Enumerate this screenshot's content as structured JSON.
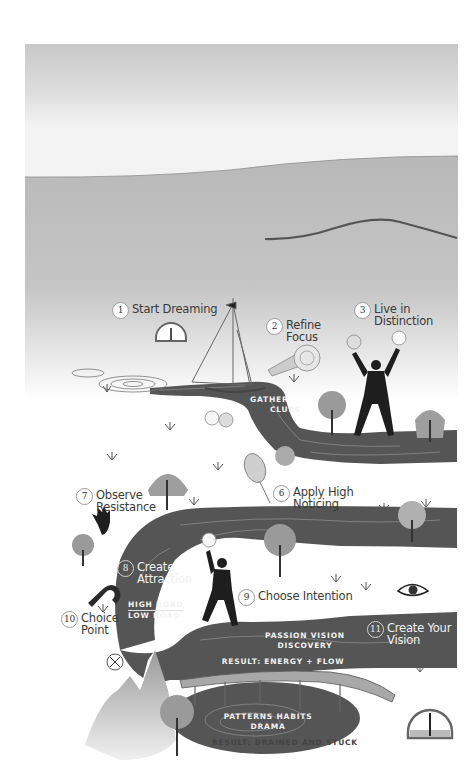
{
  "illustration": {
    "title": "Vision journey map",
    "colors": {
      "sky_top": "#c9c9c9",
      "sky_band": "#f2f2f2",
      "ground": "#bdbdbd",
      "road": "#555555",
      "road_line": "#8a8a8a",
      "figure": "#1e1e1e",
      "text": "#3a3a3a"
    },
    "steps": [
      {
        "number": "1",
        "label": "Start Dreaming"
      },
      {
        "number": "2",
        "label_line1": "Refine",
        "label_line2": "Focus"
      },
      {
        "number": "3",
        "label_line1": "Live in",
        "label_line2": "Distinction"
      },
      {
        "number": "6",
        "label_line1": "Apply High",
        "label_line2": "Noticing"
      },
      {
        "number": "7",
        "label_line1": "Observe",
        "label_line2": "Resistance"
      },
      {
        "number": "8",
        "label_line1": "Create",
        "label_line2": "Attraction"
      },
      {
        "number": "9",
        "label": "Choose Intention"
      },
      {
        "number": "10",
        "label_line1": "Choice",
        "label_line2": "Point"
      },
      {
        "number": "11",
        "label_line1": "Create Your",
        "label_line2": "Vision"
      }
    ],
    "road_text": {
      "gather_line1": "GATHER",
      "gather_line2": "CLUES",
      "high_road": "HIGH ROAD",
      "low_road": "LOW ROAD",
      "passion_vision": "PASSION   VISION",
      "discovery": "DISCOVERY",
      "result_energy": "RESULT: ENERGY + FLOW",
      "patterns_habits": "PATTERNS   HABITS",
      "drama": "DRAMA",
      "result_drained": "RESULT: DRAINED AND STUCK"
    },
    "icons": [
      "gauge-icon",
      "sailboat-icon",
      "telescope-icon",
      "lightbulb-icon",
      "person-figure-icon",
      "tree-icon",
      "willow-tree-icon",
      "balloon-icon",
      "hand-spiral-icon",
      "magnet-icon",
      "compass-icon",
      "eye-icon",
      "bridge-icon",
      "mountain-icon",
      "grass-tuft-icon"
    ]
  }
}
